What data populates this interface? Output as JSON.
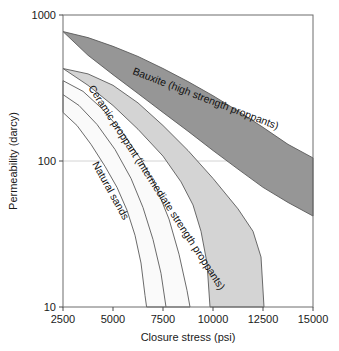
{
  "chart_data": {
    "type": "area",
    "title": "",
    "xlabel": "Closure stress (psi)",
    "ylabel": "Permeability (darcy)",
    "xlim": [
      2500,
      15000
    ],
    "ylim": [
      10,
      1000
    ],
    "yscale": "log",
    "xscale": "linear",
    "grid": true,
    "legend_position": "inline-labels",
    "xticks": [
      2500,
      5000,
      7500,
      10000,
      12500,
      15000
    ],
    "xtick_labels": [
      "2500",
      "5000",
      "7500",
      "10000",
      "12500",
      "15000"
    ],
    "yticks": [
      10,
      100,
      1000
    ],
    "ytick_labels": [
      "10",
      "100",
      "1000"
    ],
    "bands": [
      {
        "name": "bauxite",
        "label": "Bauxite (high strength proppants)",
        "fill": "#969696",
        "stroke": "#5a5a5a",
        "upper": [
          {
            "x": 2500,
            "y": 770
          },
          {
            "x": 3750,
            "y": 700
          },
          {
            "x": 5000,
            "y": 610
          },
          {
            "x": 6250,
            "y": 520
          },
          {
            "x": 7500,
            "y": 430
          },
          {
            "x": 8750,
            "y": 350
          },
          {
            "x": 10000,
            "y": 280
          },
          {
            "x": 11250,
            "y": 220
          },
          {
            "x": 12500,
            "y": 170
          },
          {
            "x": 13750,
            "y": 130
          },
          {
            "x": 15000,
            "y": 105
          }
        ],
        "lower": [
          {
            "x": 2500,
            "y": 770
          },
          {
            "x": 3750,
            "y": 530
          },
          {
            "x": 5000,
            "y": 390
          },
          {
            "x": 6250,
            "y": 290
          },
          {
            "x": 7500,
            "y": 215
          },
          {
            "x": 8750,
            "y": 160
          },
          {
            "x": 10000,
            "y": 118
          },
          {
            "x": 11250,
            "y": 88
          },
          {
            "x": 12500,
            "y": 66
          },
          {
            "x": 13750,
            "y": 52
          },
          {
            "x": 15000,
            "y": 42
          }
        ]
      },
      {
        "name": "ceramic-proppant",
        "label": "Ceramic proppant (intermediate strength proppants)",
        "fill": "#d4d4d4",
        "stroke": "#5a5a5a",
        "upper": [
          {
            "x": 2500,
            "y": 430
          },
          {
            "x": 3750,
            "y": 395
          },
          {
            "x": 5000,
            "y": 330
          },
          {
            "x": 6250,
            "y": 250
          },
          {
            "x": 7500,
            "y": 175
          },
          {
            "x": 8750,
            "y": 118
          },
          {
            "x": 10000,
            "y": 76
          },
          {
            "x": 11250,
            "y": 47
          },
          {
            "x": 12000,
            "y": 33
          },
          {
            "x": 12400,
            "y": 22
          },
          {
            "x": 12550,
            "y": 10
          }
        ],
        "lower": [
          {
            "x": 2500,
            "y": 430
          },
          {
            "x": 3750,
            "y": 330
          },
          {
            "x": 5000,
            "y": 240
          },
          {
            "x": 6250,
            "y": 165
          },
          {
            "x": 7500,
            "y": 108
          },
          {
            "x": 8400,
            "y": 72
          },
          {
            "x": 9000,
            "y": 50
          },
          {
            "x": 9400,
            "y": 33
          },
          {
            "x": 9700,
            "y": 20
          },
          {
            "x": 9850,
            "y": 10
          }
        ]
      },
      {
        "name": "natural-sands",
        "label": "Natural sands",
        "fill": "#fafafa",
        "stroke": "#5a5a5a",
        "upper": [
          {
            "x": 2500,
            "y": 355
          },
          {
            "x": 3500,
            "y": 300
          },
          {
            "x": 4500,
            "y": 225
          },
          {
            "x": 5500,
            "y": 155
          },
          {
            "x": 6500,
            "y": 98
          },
          {
            "x": 7200,
            "y": 64
          },
          {
            "x": 7800,
            "y": 40
          },
          {
            "x": 8300,
            "y": 23
          },
          {
            "x": 8700,
            "y": 13
          },
          {
            "x": 8850,
            "y": 10
          }
        ],
        "lower": [
          {
            "x": 2500,
            "y": 215
          },
          {
            "x": 3200,
            "y": 175
          },
          {
            "x": 3900,
            "y": 130
          },
          {
            "x": 4600,
            "y": 92
          },
          {
            "x": 5200,
            "y": 66
          },
          {
            "x": 5700,
            "y": 46
          },
          {
            "x": 6100,
            "y": 31
          },
          {
            "x": 6400,
            "y": 20
          },
          {
            "x": 6600,
            "y": 12
          },
          {
            "x": 6680,
            "y": 10
          }
        ]
      }
    ],
    "extra_curves": [
      {
        "name": "natural-sands-inner",
        "points": [
          {
            "x": 2500,
            "y": 285
          },
          {
            "x": 3300,
            "y": 240
          },
          {
            "x": 4200,
            "y": 178
          },
          {
            "x": 5100,
            "y": 120
          },
          {
            "x": 5900,
            "y": 76
          },
          {
            "x": 6500,
            "y": 48
          },
          {
            "x": 7000,
            "y": 29
          },
          {
            "x": 7400,
            "y": 17
          },
          {
            "x": 7650,
            "y": 10
          }
        ]
      }
    ],
    "annotations": [
      {
        "name": "bauxite-label",
        "text": "Bauxite (high strength proppants)",
        "x": 132,
        "y": 74,
        "rotation": 21
      },
      {
        "name": "ceramic-label",
        "text": "Ceramic proppant (intermediate strength proppants)",
        "x": 88,
        "y": 88,
        "rotation": 57
      },
      {
        "name": "natural-sands-label",
        "text": "Natural sands",
        "x": 92,
        "y": 164,
        "rotation": 61
      }
    ]
  },
  "axes": {
    "x_title": "Closure stress (psi)",
    "y_title": "Permeability (darcy)",
    "x_tick_labels": [
      "2500",
      "5000",
      "7500",
      "10000",
      "12500",
      "15000"
    ],
    "y_tick_labels": [
      "1000",
      "100",
      "10"
    ]
  },
  "colors": {
    "bauxite_fill": "#969696",
    "ceramic_fill": "#d4d4d4",
    "sands_fill": "#fafafa",
    "frame": "#6d6d6d",
    "grid": "#c9c9c9",
    "text": "#1a1a1a"
  }
}
